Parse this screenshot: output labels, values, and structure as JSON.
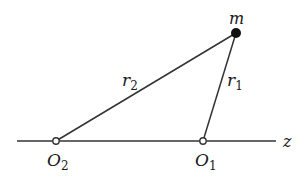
{
  "diagram": {
    "axis_label": "z",
    "mass_label": "m",
    "r1": {
      "base": "r",
      "sub": "1"
    },
    "r2": {
      "base": "r",
      "sub": "2"
    },
    "O1": {
      "base": "O",
      "sub": "1"
    },
    "O2": {
      "base": "O",
      "sub": "2"
    },
    "colors": {
      "line": "#333333",
      "mass": "#111111",
      "point_fill": "#ffffff"
    }
  }
}
